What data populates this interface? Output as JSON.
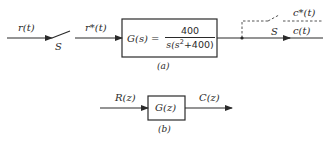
{
  "diagram_a": {
    "caption": "(a)",
    "input_signal": "r(t)",
    "sampler_label": "S",
    "sampled_signal": "r*(t)",
    "block": {
      "lhs": "G(s) =",
      "numerator": "400",
      "denominator_pre": "s(s",
      "denominator_exp": "2",
      "denominator_post": "+400)"
    },
    "output_sampler_label": "S",
    "sampled_output": "c*(t)",
    "output_signal": "c(t)"
  },
  "diagram_b": {
    "caption": "(b)",
    "input_signal": "R(z)",
    "block": "G(z)",
    "output_signal": "C(z)"
  },
  "colors": {
    "line": "#2a2a2a",
    "background": "#ffffff"
  }
}
